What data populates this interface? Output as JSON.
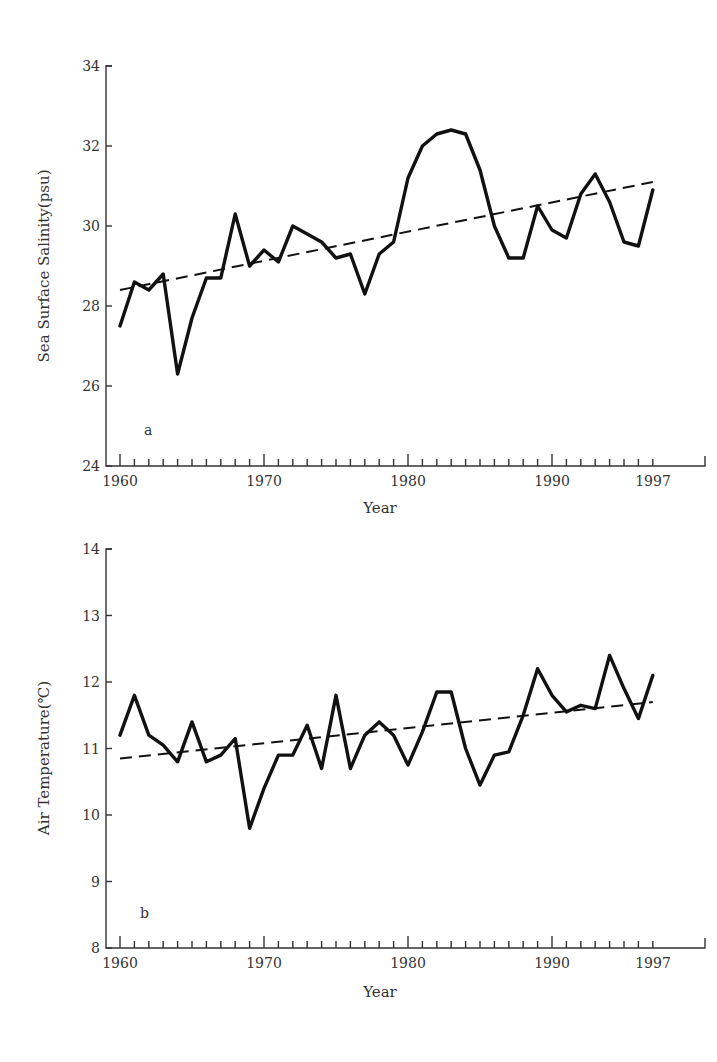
{
  "chart_data": [
    {
      "type": "line",
      "panel_label": "a",
      "title": "",
      "xlabel": "Year",
      "ylabel": "Sea Surface Salinity(psu)",
      "xlim": [
        1960,
        1997
      ],
      "ylim": [
        24,
        34
      ],
      "x_tick_labels": [
        "1960",
        "1970",
        "1980",
        "1990",
        "1997"
      ],
      "y_tick_labels": [
        "24",
        "26",
        "28",
        "30",
        "32",
        "34"
      ],
      "grid": false,
      "x": [
        1960,
        1961,
        1962,
        1963,
        1964,
        1965,
        1966,
        1967,
        1968,
        1969,
        1970,
        1971,
        1972,
        1973,
        1974,
        1975,
        1976,
        1977,
        1978,
        1979,
        1980,
        1981,
        1982,
        1983,
        1984,
        1985,
        1986,
        1987,
        1988,
        1989,
        1990,
        1991,
        1992,
        1993,
        1994,
        1995,
        1996,
        1997
      ],
      "series": [
        {
          "name": "Sea Surface Salinity",
          "style": "solid",
          "values": [
            27.5,
            28.6,
            28.4,
            28.8,
            26.3,
            27.7,
            28.7,
            28.7,
            30.3,
            29.0,
            29.4,
            29.1,
            30.0,
            29.8,
            29.6,
            29.2,
            29.3,
            28.3,
            29.3,
            29.6,
            31.2,
            32.0,
            32.3,
            32.4,
            32.3,
            31.4,
            30.0,
            29.2,
            29.2,
            30.5,
            29.9,
            29.7,
            30.8,
            31.3,
            30.6,
            29.6,
            29.5,
            30.9
          ]
        },
        {
          "name": "Linear trend",
          "style": "dashed",
          "x": [
            1960,
            1997
          ],
          "values": [
            28.4,
            31.1
          ]
        }
      ]
    },
    {
      "type": "line",
      "panel_label": "b",
      "title": "",
      "xlabel": "Year",
      "ylabel": "Air Temperature(℃)",
      "xlim": [
        1960,
        1997
      ],
      "ylim": [
        8,
        14
      ],
      "x_tick_labels": [
        "1960",
        "1970",
        "1980",
        "1990",
        "1997"
      ],
      "y_tick_labels": [
        "8",
        "9",
        "10",
        "11",
        "12",
        "13",
        "14"
      ],
      "grid": false,
      "x": [
        1960,
        1961,
        1962,
        1963,
        1964,
        1965,
        1966,
        1967,
        1968,
        1969,
        1970,
        1971,
        1972,
        1973,
        1974,
        1975,
        1976,
        1977,
        1978,
        1979,
        1980,
        1981,
        1982,
        1983,
        1984,
        1985,
        1986,
        1987,
        1988,
        1989,
        1990,
        1991,
        1992,
        1993,
        1994,
        1995,
        1996,
        1997
      ],
      "series": [
        {
          "name": "Air Temperature",
          "style": "solid",
          "values": [
            11.2,
            11.8,
            11.2,
            11.05,
            10.8,
            11.4,
            10.8,
            10.9,
            11.15,
            9.8,
            10.4,
            10.9,
            10.9,
            11.35,
            10.7,
            11.8,
            10.7,
            11.2,
            11.4,
            11.2,
            10.75,
            11.25,
            11.85,
            11.85,
            11.0,
            10.45,
            10.9,
            10.95,
            11.5,
            12.2,
            11.8,
            11.55,
            11.65,
            11.6,
            12.4,
            11.9,
            11.45,
            12.1
          ]
        },
        {
          "name": "Linear trend",
          "style": "dashed",
          "x": [
            1960,
            1997
          ],
          "values": [
            10.85,
            11.7
          ]
        }
      ]
    }
  ],
  "panels": {
    "a": {
      "label": "a",
      "ylabel": "Sea Surface Salinity(psu)",
      "xlabel": "Year",
      "yticks": [
        "24",
        "26",
        "28",
        "30",
        "32",
        "34"
      ],
      "xticks": [
        "1960",
        "1970",
        "1980",
        "1990",
        "1997"
      ]
    },
    "b": {
      "label": "b",
      "ylabel": "Air Temperature(℃)",
      "xlabel": "Year",
      "yticks": [
        "8",
        "9",
        "10",
        "11",
        "12",
        "13",
        "14"
      ],
      "xticks": [
        "1960",
        "1970",
        "1980",
        "1990",
        "1997"
      ]
    }
  }
}
